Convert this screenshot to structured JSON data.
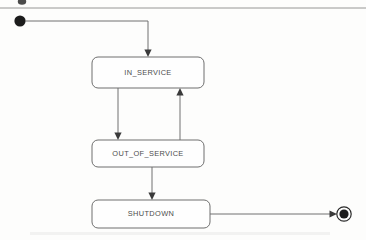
{
  "diagram": {
    "type": "uml-state-machine",
    "title": "",
    "background_color": "#fdfdfc",
    "line_color": "#707070",
    "text_color": "#4c4c4c",
    "states": [
      {
        "id": "in_service",
        "label": "IN_SERVICE",
        "shape": "rounded-rectangle",
        "x": 92,
        "y": 57,
        "width": 112,
        "height": 31
      },
      {
        "id": "out_of_service",
        "label": "OUT_OF_SERVICE",
        "shape": "rounded-rectangle",
        "x": 92,
        "y": 140,
        "width": 112,
        "height": 27
      },
      {
        "id": "shutdown",
        "label": "SHUTDOWN",
        "shape": "rounded-rectangle",
        "x": 92,
        "y": 200,
        "width": 118,
        "height": 28
      }
    ],
    "pseudo_states": [
      {
        "id": "initial",
        "kind": "initial-state",
        "shape": "filled-circle",
        "cx": 20,
        "cy": 21,
        "r": 5.6,
        "color": "#1c1c1c"
      },
      {
        "id": "final",
        "kind": "final-state",
        "shape": "bullseye",
        "cx": 344,
        "cy": 214,
        "outer_r": 7.2,
        "inner_r": 4.6,
        "color": "#1c1c1c"
      }
    ],
    "transitions": [
      {
        "id": "t1",
        "from": "initial",
        "to": "in_service",
        "label": "",
        "routing": "orthogonal",
        "arrow_direction": "down"
      },
      {
        "id": "t2",
        "from": "in_service",
        "to": "out_of_service",
        "label": "",
        "routing": "straight",
        "arrow_direction": "down"
      },
      {
        "id": "t3",
        "from": "out_of_service",
        "to": "in_service",
        "label": "",
        "routing": "straight",
        "arrow_direction": "up"
      },
      {
        "id": "t4",
        "from": "out_of_service",
        "to": "shutdown",
        "label": "",
        "routing": "straight",
        "arrow_direction": "down"
      },
      {
        "id": "t5",
        "from": "shutdown",
        "to": "final",
        "label": "",
        "routing": "straight",
        "arrow_direction": "right"
      }
    ],
    "page_artifacts": {
      "has_top_rule": true,
      "has_clipped_top_marker": true
    }
  }
}
